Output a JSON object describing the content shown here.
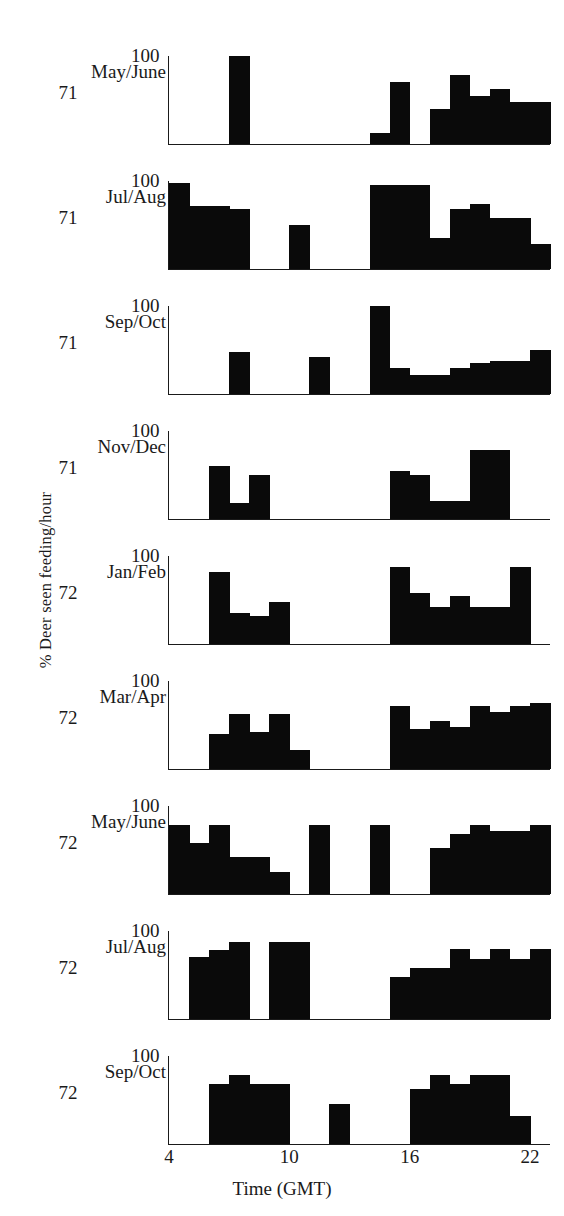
{
  "figure": {
    "ylabel": "% Deer seen feeding/hour",
    "xlabel": "Time (GMT)",
    "y_top_tick": "100",
    "xticks": [
      "4",
      "10",
      "16",
      "22"
    ],
    "ink_color": "#0a0a0a"
  },
  "chart_data": {
    "type": "bar",
    "title": "",
    "xlabel": "Time (GMT)",
    "ylabel": "% Deer seen feeding/hour",
    "xlim": [
      4,
      23
    ],
    "ylim": [
      0,
      100
    ],
    "grid": false,
    "legend": "none",
    "bin_width_hours": 1,
    "x": [
      4,
      5,
      6,
      7,
      8,
      9,
      10,
      11,
      12,
      13,
      14,
      15,
      16,
      17,
      18,
      19,
      20,
      21,
      22
    ],
    "panels": [
      {
        "label": "May/June",
        "year": "71",
        "top_tick": "100",
        "values": [
          0,
          0,
          0,
          100,
          0,
          0,
          0,
          0,
          0,
          0,
          12,
          70,
          0,
          40,
          78,
          55,
          62,
          48,
          48
        ]
      },
      {
        "label": "Jul/Aug",
        "year": "71",
        "top_tick": "100",
        "values": [
          98,
          72,
          72,
          68,
          0,
          0,
          50,
          0,
          0,
          0,
          95,
          95,
          95,
          35,
          68,
          74,
          58,
          58,
          28
        ]
      },
      {
        "label": "Sep/Oct",
        "year": "71",
        "top_tick": "100",
        "values": [
          0,
          0,
          0,
          48,
          0,
          0,
          0,
          42,
          0,
          0,
          100,
          30,
          22,
          22,
          30,
          35,
          38,
          38,
          50
        ]
      },
      {
        "label": "Nov/Dec",
        "year": "71",
        "top_tick": "100",
        "values": [
          0,
          0,
          60,
          18,
          50,
          0,
          0,
          0,
          0,
          0,
          0,
          55,
          50,
          20,
          20,
          78,
          78,
          0,
          0
        ]
      },
      {
        "label": "Jan/Feb",
        "year": "72",
        "top_tick": "100",
        "values": [
          0,
          0,
          82,
          35,
          32,
          48,
          0,
          0,
          0,
          0,
          0,
          88,
          58,
          42,
          55,
          42,
          42,
          88,
          0
        ]
      },
      {
        "label": "Mar/Apr",
        "year": "72",
        "top_tick": "100",
        "values": [
          0,
          0,
          40,
          62,
          42,
          62,
          22,
          0,
          0,
          0,
          0,
          72,
          45,
          55,
          48,
          72,
          65,
          72,
          75
        ]
      },
      {
        "label": "May/June",
        "year": "72",
        "top_tick": "100",
        "values": [
          78,
          58,
          78,
          42,
          42,
          25,
          0,
          78,
          0,
          0,
          78,
          0,
          0,
          52,
          68,
          78,
          72,
          72,
          78
        ]
      },
      {
        "label": "Jul/Aug",
        "year": "72",
        "top_tick": "100",
        "values": [
          0,
          70,
          78,
          88,
          0,
          88,
          88,
          0,
          0,
          0,
          0,
          48,
          58,
          58,
          80,
          68,
          80,
          68,
          80
        ]
      },
      {
        "label": "Sep/Oct",
        "year": "72",
        "top_tick": "100",
        "values": [
          0,
          0,
          68,
          78,
          68,
          68,
          0,
          0,
          45,
          0,
          0,
          0,
          62,
          78,
          68,
          78,
          78,
          32,
          0
        ]
      }
    ]
  }
}
